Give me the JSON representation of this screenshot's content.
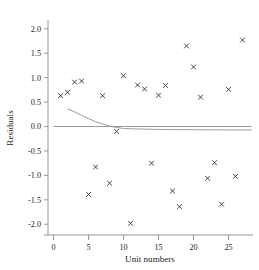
{
  "chart_data": {
    "type": "scatter",
    "title": "",
    "xlabel": "Unit numbers",
    "ylabel": "Residuals",
    "xlim": [
      -0.8,
      28.5
    ],
    "ylim": [
      -2.22,
      2.18
    ],
    "xticks": [
      "0",
      "5",
      "10",
      "15",
      "20",
      "25"
    ],
    "xtick_values": [
      0,
      5,
      10,
      15,
      20,
      25
    ],
    "yticks": [
      "2.0",
      "1.5",
      "1.0",
      "0.5",
      "0.0",
      "-0.5",
      "-1.0",
      "-1.5",
      "-2.0"
    ],
    "ytick_values": [
      2.0,
      1.5,
      1.0,
      0.5,
      0.0,
      -0.5,
      -1.0,
      -1.5,
      -2.0
    ],
    "grid": false,
    "legend": "none",
    "marker": "x-in-box",
    "x": [
      1,
      2,
      3,
      4,
      5,
      6,
      7,
      8,
      9,
      10,
      11,
      12,
      13,
      14,
      15,
      16,
      17,
      18,
      19,
      20,
      21,
      22,
      23,
      24,
      25,
      26,
      27
    ],
    "y": [
      0.63,
      0.7,
      0.91,
      0.93,
      -1.39,
      -0.83,
      0.63,
      -1.16,
      -0.1,
      1.04,
      -1.98,
      0.85,
      0.77,
      -0.75,
      0.64,
      0.84,
      -1.32,
      -1.64,
      1.65,
      1.22,
      0.6,
      -1.06,
      -0.74,
      -1.59,
      0.76,
      -1.02,
      1.77
    ],
    "reference_lines": [
      {
        "name": "zero-reference-line",
        "description": "horizontal line at y = 0 extending across plot",
        "y": 0.0
      },
      {
        "name": "smoothed-fit-curve",
        "description": "decaying curve starting near y = 0.36 at x = 2 and flattening to about y = -0.07",
        "points": [
          [
            2.0,
            0.36
          ],
          [
            3.0,
            0.3
          ],
          [
            4.0,
            0.23
          ],
          [
            5.0,
            0.16
          ],
          [
            6.0,
            0.1
          ],
          [
            7.0,
            0.05
          ],
          [
            8.0,
            0.01
          ],
          [
            9.0,
            -0.02
          ],
          [
            10.0,
            -0.04
          ],
          [
            12.0,
            -0.05
          ],
          [
            15.0,
            -0.06
          ],
          [
            20.0,
            -0.065
          ],
          [
            25.0,
            -0.07
          ],
          [
            28.3,
            -0.07
          ]
        ]
      }
    ],
    "colors": {
      "marker": "#3a3a3a",
      "axis": "#8d8d8d",
      "curve": "#9a9a9a",
      "background": "#ffffff"
    }
  }
}
